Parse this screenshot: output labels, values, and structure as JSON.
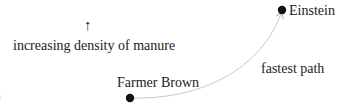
{
  "diagram": {
    "up_arrow": "↑",
    "gradient_label": "increasing density of manure",
    "nodes": [
      {
        "id": "farmer",
        "label": "Farmer Brown"
      },
      {
        "id": "einstein",
        "label": "Einstein"
      }
    ],
    "edge_label": "fastest path",
    "edge_mark": ")",
    "colors": {
      "node": "#111111",
      "path": "#c8c8c8",
      "text": "#222222"
    }
  }
}
